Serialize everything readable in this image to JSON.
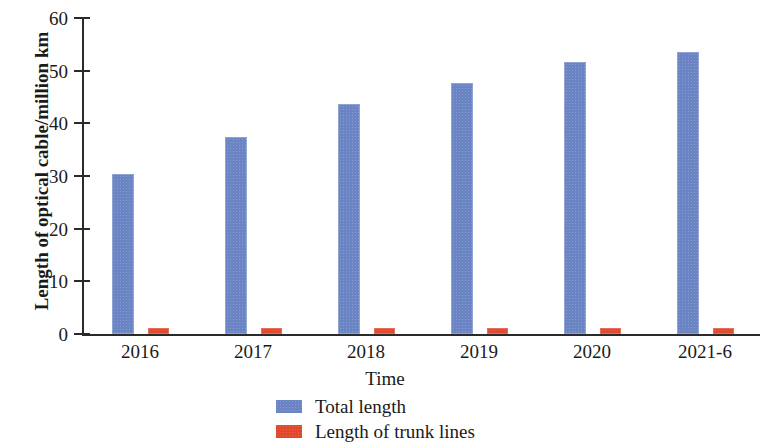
{
  "chart_data": {
    "type": "bar",
    "title": "",
    "xlabel": "Time",
    "ylabel": "Length of optical cable/million km",
    "categories": [
      "2016",
      "2017",
      "2018",
      "2019",
      "2020",
      "2021-6"
    ],
    "series": [
      {
        "name": "Total length",
        "color": "#6b85c4",
        "values": [
          30.4,
          37.4,
          43.7,
          47.7,
          51.7,
          53.6
        ]
      },
      {
        "name": "Length of trunk lines",
        "color": "#e2492c",
        "values": [
          1.1,
          1.1,
          1.1,
          1.0,
          1.0,
          1.0
        ]
      }
    ],
    "ylim": [
      0,
      60
    ],
    "yticks": [
      "0",
      "10",
      "20",
      "30",
      "40",
      "50",
      "60"
    ],
    "grid": false,
    "legend_position": "bottom"
  },
  "axes": {
    "y_title": "Length of optical cable/million km",
    "x_title": "Time",
    "y_ticks": [
      "60",
      "50",
      "40",
      "30",
      "20",
      "10",
      "0"
    ],
    "x_ticks": [
      "2016",
      "2017",
      "2018",
      "2019",
      "2020",
      "2021-6"
    ]
  },
  "legend": {
    "items": [
      {
        "label": "Total length",
        "color": "#6b85c4"
      },
      {
        "label": "Length of trunk lines",
        "color": "#e2492c"
      }
    ]
  }
}
